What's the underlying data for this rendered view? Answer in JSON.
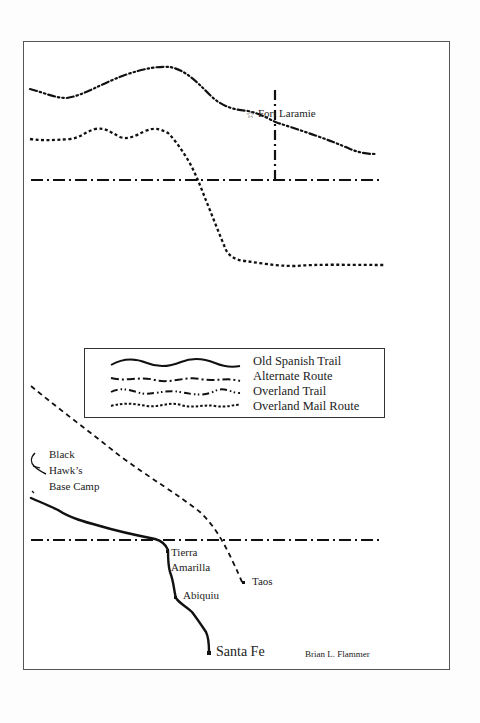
{
  "map": {
    "legend": {
      "items": [
        {
          "label": "Old Spanish Trail",
          "style": "solid"
        },
        {
          "label": "Alternate Route",
          "style": "dash-dot-irregular"
        },
        {
          "label": "Overland Trail",
          "style": "dash-dot-dot"
        },
        {
          "label": "Overland Mail Route",
          "style": "short-dash-wavy"
        }
      ]
    },
    "places": {
      "fort_laramie": "Fort Laramie",
      "black_hawk_line1": "Black",
      "black_hawk_line2": "Hawk’s",
      "black_hawk_line3": "Base Camp",
      "tierra_line1": "Tierra",
      "tierra_line2": "Amarilla",
      "abiquiu": "Abiquiu",
      "taos": "Taos",
      "santa_fe": "Santa Fe"
    },
    "credit": "Brian L. Flammer",
    "colors": {
      "ink": "#111111",
      "frame": "#555555",
      "paper": "#ffffff"
    }
  }
}
